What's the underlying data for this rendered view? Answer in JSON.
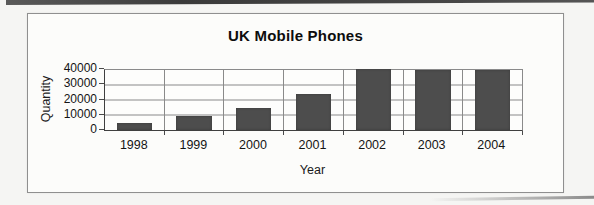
{
  "chart_data": {
    "type": "bar",
    "title": "UK Mobile Phones",
    "xlabel": "Year",
    "ylabel": "Quantity",
    "categories": [
      "1998",
      "1999",
      "2000",
      "2001",
      "2002",
      "2003",
      "2004"
    ],
    "values": [
      5000,
      9500,
      14500,
      24000,
      40500,
      40000,
      40000
    ],
    "ylim": [
      0,
      40000
    ],
    "yticks": [
      0,
      10000,
      20000,
      30000,
      40000
    ],
    "grid": true,
    "legend": "none",
    "bar_color": "#4d4d4d",
    "gridline_color": "#8a8a8a"
  }
}
